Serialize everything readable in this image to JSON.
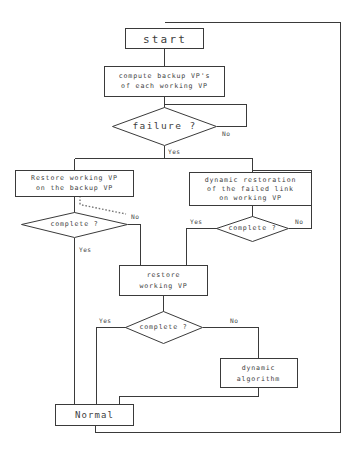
{
  "diagram": {
    "type": "flowchart",
    "background_color": "#ffffff",
    "line_color": "#3a3a3a",
    "text_color": "#3d3d3d"
  },
  "nodes": {
    "start": {
      "shape": "box",
      "label": "start"
    },
    "compute_backup": {
      "shape": "box",
      "line1": "compute backup VP's",
      "line2": "of each working VP"
    },
    "failure_check": {
      "shape": "diamond",
      "label": "failure ?"
    },
    "restore_backup": {
      "shape": "box",
      "line1": "Restore working VP",
      "line2": "on the backup VP"
    },
    "dynamic_restoration": {
      "shape": "box",
      "line1": "dynamic restoration",
      "line2": "of the failed link",
      "line3": "on working VP"
    },
    "complete_left": {
      "shape": "diamond",
      "label": "complete ?"
    },
    "complete_right": {
      "shape": "diamond",
      "label": "complete ?"
    },
    "restore_working": {
      "shape": "box",
      "line1": "restore",
      "line2": "working VP"
    },
    "complete_lower": {
      "shape": "diamond",
      "label": "complete ?"
    },
    "dynamic_algorithm": {
      "shape": "box",
      "line1": "dynamic",
      "line2": "algorithm"
    },
    "normal": {
      "shape": "box",
      "label": "Normal"
    }
  },
  "edge_labels": {
    "failure_no": "No",
    "failure_yes": "Yes",
    "complete_left_no": "No",
    "complete_left_yes": "Yes",
    "complete_right_yes": "Yes",
    "complete_right_no": "No",
    "complete_lower_yes": "Yes",
    "complete_lower_no": "No"
  }
}
